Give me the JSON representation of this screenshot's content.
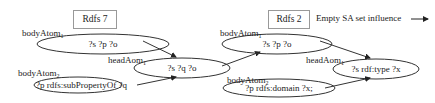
{
  "diagram": {
    "rules": [
      {
        "title": "Rdfs 7",
        "body_atoms": [
          {
            "label": "bodyAtom",
            "sub": "1",
            "text": "?s ?p ?o"
          },
          {
            "label": "bodyAtom",
            "sub": "2",
            "text": "?p rdfs:subPropertyOf ?q"
          }
        ],
        "head_atom": {
          "label": "headAom",
          "sub": "1",
          "text": "?s ?q ?o"
        }
      },
      {
        "title": "Rdfs 2",
        "body_atoms": [
          {
            "label": "bodyAtom",
            "sub": "1",
            "text": "?s ?p ?o"
          },
          {
            "label": "bodyAtom",
            "sub": "2",
            "text": "?p rdfs:domain ?x;"
          }
        ],
        "head_atom": {
          "label": "headAom",
          "sub": "1",
          "text": "?s rdf:type ?x"
        }
      }
    ],
    "legend": {
      "text": "Empty SA set influence",
      "icon": "arrow-right-icon"
    },
    "colors": {
      "stroke": "#333333",
      "box_border": "#999999"
    }
  }
}
